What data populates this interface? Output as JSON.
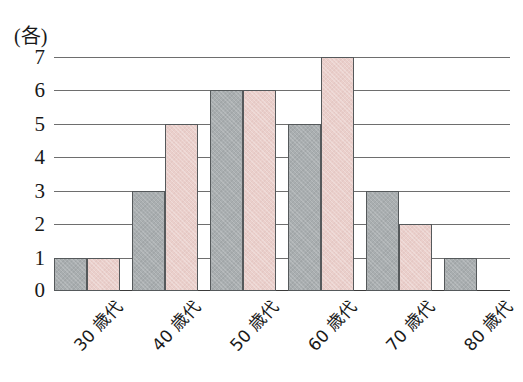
{
  "chart_data": {
    "type": "bar",
    "title": "",
    "subtitle": "",
    "xlabel": "",
    "ylabel": "(各)",
    "unit_label": "(各)",
    "categories": [
      "30 歳代",
      "40 歳代",
      "50 歳代",
      "60 歳代",
      "70 歳代",
      "80 歳代"
    ],
    "series": [
      {
        "name": "gray",
        "color": "#a9aeb0",
        "values": [
          1,
          3,
          6,
          5,
          3,
          1
        ]
      },
      {
        "name": "pink",
        "color": "#eacfcb",
        "values": [
          1,
          5,
          6,
          7,
          2,
          0
        ]
      }
    ],
    "ylim": [
      0,
      7
    ],
    "ytick_labels": [
      "0",
      "1",
      "2",
      "3",
      "4",
      "5",
      "6",
      "7"
    ],
    "ytick_values": [
      0,
      1,
      2,
      3,
      4,
      5,
      6,
      7
    ],
    "grid": true,
    "legend": "none",
    "bar_border_color": "#55595b",
    "gridline_color": "#6e6e6e",
    "axis_color": "#3a3a3a",
    "background": "#ffffff"
  }
}
